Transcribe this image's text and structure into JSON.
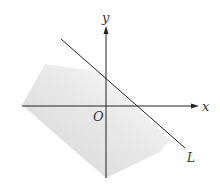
{
  "diagram": {
    "axes": {
      "x_label": "x",
      "y_label": "y",
      "origin_label": "O"
    },
    "line": {
      "label": "L"
    },
    "colors": {
      "axis": "#222222",
      "line": "#222222",
      "shade": "#c8c8c8",
      "background": "#ffffff"
    }
  }
}
